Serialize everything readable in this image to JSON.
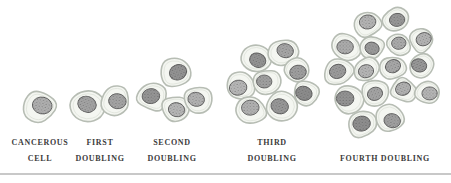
{
  "figure": {
    "stages": [
      {
        "id": "cancerous-cell",
        "label_lines": [
          "CANCEROUS",
          "CELL"
        ],
        "cell_count": 1
      },
      {
        "id": "first-doubling",
        "label_lines": [
          "FIRST",
          "DOUBLING"
        ],
        "cell_count": 2
      },
      {
        "id": "second-doubling",
        "label_lines": [
          "SECOND",
          "DOUBLING"
        ],
        "cell_count": 4
      },
      {
        "id": "third-doubling",
        "label_lines": [
          "THIRD",
          "DOUBLING"
        ],
        "cell_count": 8
      },
      {
        "id": "fourth-doubling",
        "label_lines": [
          "",
          "FOURTH DOUBLING"
        ],
        "cell_count": 16
      }
    ],
    "colors": {
      "background": "#ffffff",
      "cell_body": "#f4f6f1",
      "cell_outline": "#b7bdb4",
      "cell_inner_line": "#e3e7df",
      "nucleus_outline": "#606060",
      "label_text": "#3c3c3c",
      "divider": "#c8c8c8"
    }
  }
}
